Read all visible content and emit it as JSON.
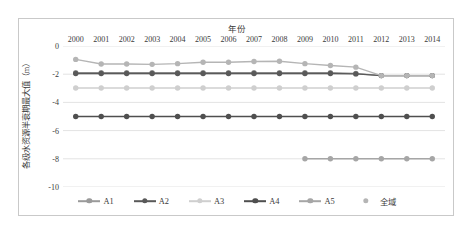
{
  "chart_data": {
    "type": "line",
    "title": "",
    "xlabel": "年份",
    "ylabel": "各级水资源半衰期最大值（m）",
    "xlabel_position": "top",
    "x": [
      "2000",
      "2001",
      "2002",
      "2003",
      "2004",
      "2005",
      "2006",
      "2007",
      "2008",
      "2009",
      "2010",
      "2011",
      "2012",
      "2013",
      "2014"
    ],
    "categories": [
      "2000",
      "2001",
      "2002",
      "2003",
      "2004",
      "2005",
      "2006",
      "2007",
      "2008",
      "2009",
      "2010",
      "2011",
      "2012",
      "2013",
      "2014"
    ],
    "xlim": [
      2000,
      2014
    ],
    "ylim": [
      -10,
      0
    ],
    "yticks": [
      0,
      -2,
      -4,
      -6,
      -8,
      -10
    ],
    "ytick_labels": [
      "0",
      "-2",
      "-4",
      "-6",
      "-8",
      "-10"
    ],
    "grid": "horizontal",
    "legend_position": "bottom",
    "series": [
      {
        "name": "A1",
        "color": "#9a9a9a",
        "values": [
          -1.9,
          -1.9,
          -1.9,
          -1.9,
          -1.9,
          -1.9,
          -1.9,
          -1.9,
          -1.9,
          -1.9,
          -1.9,
          -1.95,
          -2.1,
          -2.1,
          -2.1
        ]
      },
      {
        "name": "A2",
        "color": "#595959",
        "values": [
          -1.95,
          -1.95,
          -1.95,
          -1.95,
          -1.95,
          -1.95,
          -1.95,
          -1.95,
          -1.95,
          -1.95,
          -1.95,
          -1.98,
          -2.1,
          -2.1,
          -2.1
        ]
      },
      {
        "name": "A3",
        "color": "#cfcfcf",
        "values": [
          -2.98,
          -2.98,
          -2.98,
          -2.98,
          -2.98,
          -2.98,
          -2.98,
          -2.98,
          -2.98,
          -2.98,
          -2.98,
          -2.98,
          -2.98,
          -2.98,
          -2.98
        ]
      },
      {
        "name": "A4",
        "color": "#4f4f4f",
        "values": [
          -5.0,
          -5.0,
          -5.0,
          -5.0,
          -5.0,
          -5.0,
          -5.0,
          -5.0,
          -5.0,
          -5.0,
          -5.0,
          -5.0,
          -5.0,
          -5.0,
          -5.0
        ]
      },
      {
        "name": "A5",
        "color": "#a6a6a6",
        "values": [
          null,
          null,
          null,
          null,
          null,
          null,
          null,
          null,
          null,
          -8.0,
          -8.0,
          -8.0,
          -8.0,
          -8.0,
          -8.0
        ]
      },
      {
        "name": "全域",
        "color": "#b5b5b5",
        "values": [
          -0.95,
          -1.28,
          -1.28,
          -1.3,
          -1.25,
          -1.15,
          -1.15,
          -1.1,
          -1.08,
          -1.25,
          -1.38,
          -1.5,
          -2.1,
          -2.1,
          -2.1
        ]
      }
    ]
  },
  "legend": {
    "items": [
      {
        "label": "A1",
        "marker": "line-dot"
      },
      {
        "label": "A2",
        "marker": "line-dot"
      },
      {
        "label": "A3",
        "marker": "line-dot"
      },
      {
        "label": "A4",
        "marker": "line-dot"
      },
      {
        "label": "A5",
        "marker": "line-dot"
      },
      {
        "label": "全域",
        "marker": "dot"
      }
    ]
  },
  "style": {
    "plot_background": "#ffffff",
    "frame_border": "#c9c9c9",
    "gridline_color": "#e3e3e3",
    "text_color": "#3a3a3a"
  }
}
